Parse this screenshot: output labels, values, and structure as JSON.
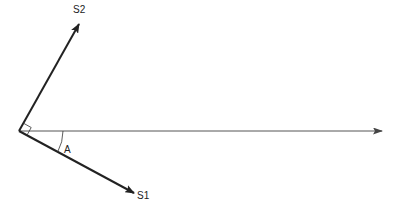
{
  "diagram": {
    "type": "vector-diagram",
    "origin": {
      "x": 19,
      "y": 131
    },
    "vectors": [
      {
        "name": "S2",
        "label": "S2",
        "tip": {
          "x": 79,
          "y": 24
        },
        "label_pos": {
          "x": 73,
          "y": 13
        }
      },
      {
        "name": "S1",
        "label": "S1",
        "tip": {
          "x": 134,
          "y": 193
        },
        "label_pos": {
          "x": 137,
          "y": 199
        }
      },
      {
        "name": "reference-axis",
        "label": "",
        "tip": {
          "x": 383,
          "y": 131
        }
      }
    ],
    "angle": {
      "label": "A",
      "label_pos": {
        "x": 65,
        "y": 153
      }
    },
    "right_angle_marker": true,
    "colors": {
      "line": "#222222",
      "axis": "#555555"
    }
  }
}
